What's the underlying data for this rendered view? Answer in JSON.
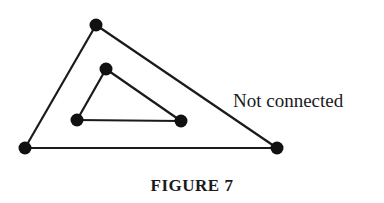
{
  "figure": {
    "caption": "FIGURE 7",
    "annotation": "Not connected",
    "colors": {
      "stroke": "#1a1a1a",
      "vertex": "#111111",
      "background": "#ffffff"
    },
    "graph": {
      "outer_triangle": {
        "vertices": [
          [
            96,
            25
          ],
          [
            25,
            148
          ],
          [
            277,
            148
          ]
        ],
        "edges": [
          [
            0,
            1
          ],
          [
            1,
            2
          ],
          [
            2,
            0
          ]
        ]
      },
      "inner_triangle": {
        "vertices": [
          [
            106,
            69
          ],
          [
            77,
            120
          ],
          [
            181,
            121
          ]
        ],
        "edges": [
          [
            0,
            1
          ],
          [
            1,
            2
          ],
          [
            2,
            0
          ]
        ]
      },
      "connected": false
    }
  }
}
